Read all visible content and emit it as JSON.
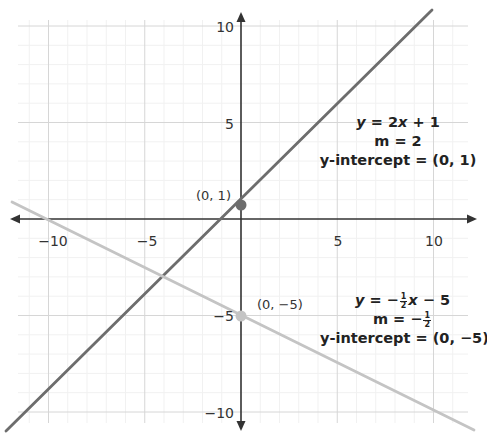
{
  "chart_data": {
    "type": "line",
    "title": "",
    "xlabel": "",
    "ylabel": "",
    "xlim": [
      -12.2,
      12.2
    ],
    "ylim": [
      -11,
      10.9
    ],
    "x_ticks": [
      -10,
      -5,
      5,
      10
    ],
    "y_ticks": [
      10,
      5,
      -5,
      -10
    ],
    "x_tick_labels": [
      "−10",
      "−5",
      "5",
      "10"
    ],
    "y_tick_labels": [
      "10",
      "5",
      "−5",
      "−10"
    ],
    "grid": {
      "major_step": 5,
      "minor_step": 1,
      "on": true
    },
    "series": [
      {
        "name": "y = 2x + 1",
        "equation": "y = 2x + 1",
        "slope": 2,
        "intercept": 1,
        "color": "#6d6d6d",
        "x": [
          -6,
          4.9
        ],
        "y": [
          -11,
          10.8
        ]
      },
      {
        "name": "y = -1/2 x - 5",
        "equation": "y = −½x − 5",
        "slope": -0.5,
        "intercept": -5,
        "color": "#c4c4c4",
        "x": [
          -12.2,
          12.2
        ],
        "y": [
          1.1,
          -11.1
        ]
      }
    ],
    "points": [
      {
        "x": 0,
        "y": 1,
        "label": "(0, 1)",
        "color": "#6d6d6d"
      },
      {
        "x": 0,
        "y": -5,
        "label": "(0, −5)",
        "color": "#c4c4c4"
      }
    ],
    "annotations": [
      {
        "lines": [
          "y = 2x + 1",
          "m = 2",
          "y-intercept = (0, 1)"
        ]
      },
      {
        "lines": [
          "y = −½x − 5",
          "m = −½",
          "y-intercept = (0, −5)"
        ]
      }
    ]
  },
  "labels": {
    "point1": "(0, 1)",
    "point2": "(0, −5)",
    "line1": {
      "eq_y": "y",
      "eq_mid": " = 2",
      "eq_x": "x",
      "eq_end": " + 1",
      "slope": "m = 2",
      "intercept": "y-intercept = (0, 1)"
    },
    "line2": {
      "eq_y": "y",
      "eq_mid": " = −",
      "frac_num": "1",
      "frac_den": "2",
      "eq_x": "x",
      "eq_end": " − 5",
      "slope_prefix": "m = −",
      "intercept": "y-intercept = (0, −5)"
    }
  },
  "ticks": {
    "x_neg10": "−10",
    "x_neg5": "−5",
    "x_5": "5",
    "x_10": "10",
    "y_10": "10",
    "y_5": "5",
    "y_neg5": "−5",
    "y_neg10": "−10"
  },
  "colors": {
    "axis": "#333333",
    "major_grid": "#d9d9d9",
    "minor_grid": "#f0f0f0",
    "line1": "#6d6d6d",
    "line2": "#c4c4c4"
  }
}
